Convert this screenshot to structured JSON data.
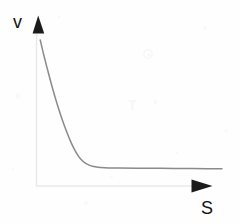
{
  "figure": {
    "background_color": "#fefefe",
    "axis_color": "#e6e6e6",
    "arrow_color": "#1a1a1a",
    "curve_color": "#8a8a8a",
    "label_color": "#111111",
    "y_axis_label": "v",
    "x_axis_label": "S"
  },
  "chart_data": {
    "type": "line",
    "title": "",
    "xlabel": "S",
    "ylabel": "v",
    "grid": false,
    "legend": null,
    "axis_style": "arrow-ended, no tick marks, no numeric tick labels",
    "xlim": [
      0,
      1
    ],
    "ylim": [
      0,
      1
    ],
    "series": [
      {
        "name": "v(S)",
        "color": "#8a8a8a",
        "x": [
          0.01,
          0.03,
          0.055,
          0.08,
          0.105,
          0.13,
          0.155,
          0.18,
          0.205,
          0.23,
          0.26,
          0.3,
          0.36,
          0.44,
          0.54,
          0.66,
          0.79,
          0.92,
          1.0
        ],
        "y": [
          0.985,
          0.88,
          0.76,
          0.645,
          0.54,
          0.445,
          0.36,
          0.285,
          0.225,
          0.18,
          0.148,
          0.128,
          0.12,
          0.118,
          0.117,
          0.116,
          0.115,
          0.114,
          0.113
        ]
      }
    ],
    "annotations": [
      {
        "name": "y-axis-arrowhead",
        "shape": "filled-triangle",
        "points-to": "up"
      },
      {
        "name": "x-axis-arrowhead",
        "shape": "filled-triangle",
        "points-to": "right"
      }
    ]
  }
}
